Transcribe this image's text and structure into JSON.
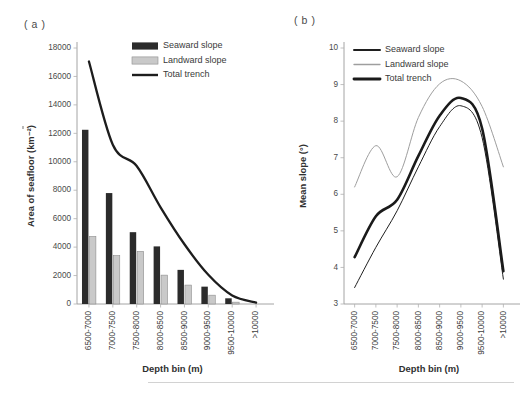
{
  "figure": {
    "panel_a_label": "( a )",
    "panel_b_label": "( b )"
  },
  "chart_data": [
    {
      "id": "panel-a",
      "type": "bar",
      "title": "",
      "panel": "( a )",
      "xlabel": "Depth bin (m)",
      "ylabel": "Area of seafloor (km⁻²)",
      "categories": [
        "6500-7000",
        "7000-7500",
        "7500-8000",
        "8000-8500",
        "8500-9000",
        "9000-9500",
        "9500-10000",
        ">10000"
      ],
      "yticks": [
        0,
        2000,
        4000,
        6000,
        8000,
        10000,
        12000,
        14000,
        16000,
        18000
      ],
      "ylim": [
        0,
        18000
      ],
      "grid": false,
      "legend_position": "top-right",
      "series": [
        {
          "name": "Seaward slope",
          "kind": "bar",
          "color": "#2b2b2b",
          "values": [
            12250,
            7800,
            5050,
            4050,
            2400,
            1220,
            400,
            0
          ]
        },
        {
          "name": "Landward slope",
          "kind": "bar",
          "color": "#c9c9c9",
          "values": [
            4750,
            3400,
            3700,
            2030,
            1330,
            620,
            130,
            0
          ]
        },
        {
          "name": "Total trench",
          "kind": "line",
          "color": "#1d1d1d",
          "values": [
            17050,
            11200,
            9700,
            6800,
            4200,
            2050,
            600,
            100
          ]
        }
      ]
    },
    {
      "id": "panel-b",
      "type": "line",
      "title": "",
      "panel": "( b )",
      "xlabel": "Depth bin (m)",
      "ylabel": "Mean slope (°)",
      "categories": [
        "6500-7000",
        "7000-7500",
        "7500-8000",
        "8000-8500",
        "8500-9000",
        "9000-9500",
        "9500-10000",
        ">10000"
      ],
      "yticks": [
        3,
        4,
        5,
        6,
        7,
        8,
        9,
        10
      ],
      "ylim": [
        3,
        10
      ],
      "grid": false,
      "legend_position": "top-left",
      "series": [
        {
          "name": "Seaward slope",
          "kind": "line",
          "color": "#1f1f1f",
          "width": "thin",
          "values": [
            3.45,
            4.55,
            5.55,
            6.75,
            7.85,
            8.42,
            7.55,
            3.68
          ]
        },
        {
          "name": "Landward slope",
          "kind": "line",
          "color": "#9e9e9e",
          "width": "thin",
          "values": [
            6.2,
            7.33,
            6.48,
            8.1,
            9.02,
            9.1,
            8.4,
            6.75
          ]
        },
        {
          "name": "Total trench",
          "kind": "line",
          "color": "#1a1a1a",
          "width": "thick",
          "values": [
            4.28,
            5.4,
            5.85,
            7.05,
            8.15,
            8.63,
            7.8,
            3.9
          ]
        }
      ]
    }
  ]
}
